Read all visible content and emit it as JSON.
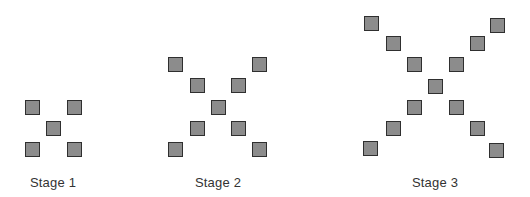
{
  "colors": {
    "square_fill": "#8c8c8c",
    "square_border": "#2f2f2f",
    "label": "#333333"
  },
  "stages": [
    {
      "label": "Stage 1",
      "label_center_x": 53,
      "squares": [
        [
          25,
          100
        ],
        [
          67,
          100
        ],
        [
          46,
          121
        ],
        [
          25,
          142
        ],
        [
          67,
          142
        ]
      ]
    },
    {
      "label": "Stage 2",
      "label_center_x": 218,
      "squares": [
        [
          168,
          57
        ],
        [
          252,
          57
        ],
        [
          190,
          78
        ],
        [
          231,
          78
        ],
        [
          211,
          100
        ],
        [
          190,
          121
        ],
        [
          231,
          121
        ],
        [
          168,
          142
        ],
        [
          252,
          142
        ]
      ]
    },
    {
      "label": "Stage 3",
      "label_center_x": 435,
      "squares": [
        [
          364,
          16
        ],
        [
          490,
          18
        ],
        [
          386,
          36
        ],
        [
          470,
          36
        ],
        [
          407,
          57
        ],
        [
          449,
          57
        ],
        [
          428,
          79
        ],
        [
          407,
          100
        ],
        [
          449,
          100
        ],
        [
          386,
          121
        ],
        [
          470,
          121
        ],
        [
          363,
          141
        ],
        [
          489,
          143
        ]
      ]
    }
  ]
}
